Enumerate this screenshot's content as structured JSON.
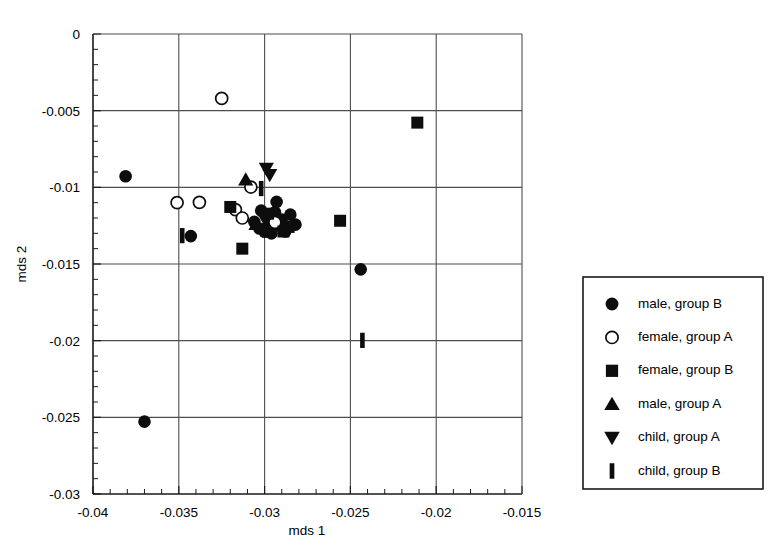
{
  "chart_data": {
    "type": "scatter",
    "title": "",
    "xlabel": "mds 1",
    "ylabel": "mds 2",
    "xlim": [
      -0.04,
      -0.015
    ],
    "ylim": [
      -0.03,
      0.0
    ],
    "grid": true,
    "x_ticks": [
      "-0.04",
      "-0.035",
      "-0.03",
      "-0.025",
      "-0.02",
      "-0.015"
    ],
    "x_tick_values": [
      -0.04,
      -0.035,
      -0.03,
      -0.025,
      -0.02,
      -0.015
    ],
    "y_ticks": [
      "0",
      "-0.005",
      "-0.01",
      "-0.015",
      "-0.02",
      "-0.025",
      "-0.03"
    ],
    "y_tick_values": [
      0.0,
      -0.005,
      -0.01,
      -0.015,
      -0.02,
      -0.025,
      -0.03
    ],
    "x_minor_step": 0.001,
    "y_minor_step": 0.001,
    "legend_position": "right-outside",
    "series": [
      {
        "name": "male, group B",
        "marker": "circle-filled",
        "color": "#0d0d0d",
        "points": [
          [
            -0.0381,
            -0.00928
          ],
          [
            -0.0343,
            -0.01318
          ],
          [
            -0.0302,
            -0.01152
          ],
          [
            -0.0299,
            -0.01185
          ],
          [
            -0.0297,
            -0.01223
          ],
          [
            -0.0294,
            -0.01163
          ],
          [
            -0.0292,
            -0.01248
          ],
          [
            -0.029,
            -0.0121
          ],
          [
            -0.0303,
            -0.01268
          ],
          [
            -0.03,
            -0.0129
          ],
          [
            -0.0296,
            -0.013
          ],
          [
            -0.0306,
            -0.01225
          ],
          [
            -0.0285,
            -0.01178
          ],
          [
            -0.0282,
            -0.01243
          ],
          [
            -0.0288,
            -0.01288
          ],
          [
            -0.0293,
            -0.01095
          ],
          [
            -0.0244,
            -0.01535
          ],
          [
            -0.037,
            -0.02528
          ]
        ]
      },
      {
        "name": "female, group A",
        "marker": "circle-open",
        "color": "#ffffff",
        "points": [
          [
            -0.0325,
            -0.0042
          ],
          [
            -0.0351,
            -0.011
          ],
          [
            -0.0338,
            -0.01098
          ],
          [
            -0.0308,
            -0.00998
          ],
          [
            -0.0317,
            -0.01145
          ],
          [
            -0.0313,
            -0.012
          ],
          [
            -0.0294,
            -0.01228
          ]
        ]
      },
      {
        "name": "female, group B",
        "marker": "square-filled",
        "color": "#0d0d0d",
        "points": [
          [
            -0.0211,
            -0.00578
          ],
          [
            -0.0256,
            -0.01218
          ],
          [
            -0.0313,
            -0.014
          ],
          [
            -0.032,
            -0.01128
          ],
          [
            -0.0286,
            -0.01258
          ],
          [
            -0.0289,
            -0.01288
          ],
          [
            -0.0298,
            -0.01172
          ]
        ]
      },
      {
        "name": "male, group A",
        "marker": "triangle-up",
        "color": "#0d0d0d",
        "points": [
          [
            -0.0311,
            -0.0095
          ],
          [
            -0.03,
            -0.01265
          ],
          [
            -0.0305,
            -0.0124
          ]
        ]
      },
      {
        "name": "child, group A",
        "marker": "triangle-down",
        "color": "#0d0d0d",
        "points": [
          [
            -0.0299,
            -0.00878
          ],
          [
            -0.0297,
            -0.00918
          ],
          [
            -0.03,
            -0.01205
          ]
        ]
      },
      {
        "name": "child, group B",
        "marker": "bar-vertical",
        "color": "#0d0d0d",
        "points": [
          [
            -0.0348,
            -0.01315
          ],
          [
            -0.0302,
            -0.01008
          ],
          [
            -0.0243,
            -0.01998
          ]
        ]
      }
    ]
  },
  "legend": {
    "items": [
      {
        "label": "male, group B",
        "marker": "circle-filled"
      },
      {
        "label": "female, group A",
        "marker": "circle-open"
      },
      {
        "label": "female, group B",
        "marker": "square-filled"
      },
      {
        "label": "male, group A",
        "marker": "triangle-up"
      },
      {
        "label": "child, group A",
        "marker": "triangle-down"
      },
      {
        "label": "child, group B",
        "marker": "bar-vertical"
      }
    ]
  }
}
